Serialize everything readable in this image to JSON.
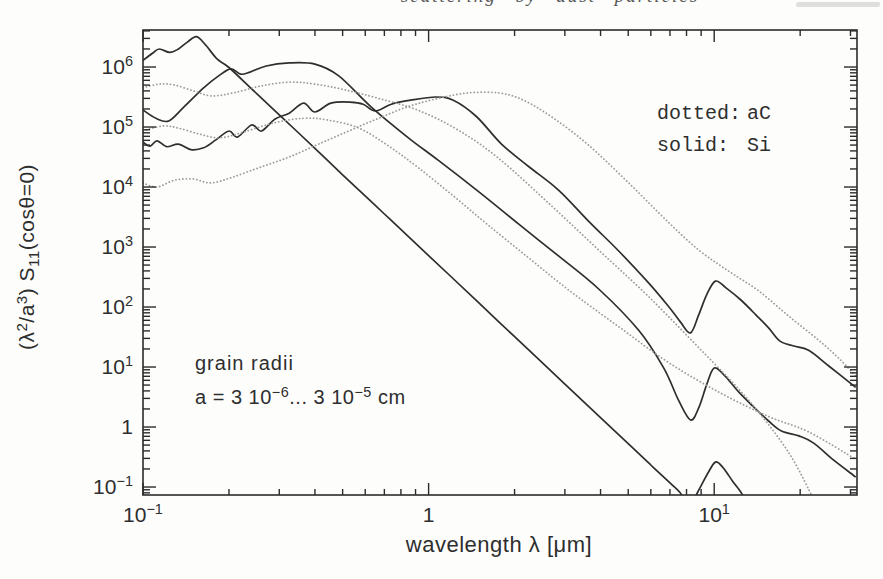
{
  "page": {
    "background": "#fdfdfc"
  },
  "header": {
    "fragment": "scattering by dust particles"
  },
  "chart_data": {
    "type": "line",
    "title": "",
    "xlabel": "wavelength λ [μm]",
    "ylabel_parts": [
      [
        "(λ",
        "n"
      ],
      [
        "2",
        "sup"
      ],
      [
        "/a",
        "n"
      ],
      [
        "3",
        "sup"
      ],
      [
        ")  S",
        "n"
      ],
      [
        "11",
        "sub"
      ],
      [
        "(cosθ=0)",
        "n"
      ]
    ],
    "x_axis": {
      "scale": "log",
      "min": 0.1,
      "max": 31.6,
      "log_min": -1,
      "log_max": 1.5,
      "grid": false,
      "tick_labels": [
        {
          "value": 0.1,
          "base": "10",
          "exp": "−1"
        },
        {
          "value": 1,
          "base": "1",
          "exp": ""
        },
        {
          "value": 10,
          "base": "10",
          "exp": "1"
        }
      ]
    },
    "y_axis": {
      "scale": "log",
      "min": 0.0736,
      "max": 4140000,
      "log_min": -1.133,
      "log_max": 6.617,
      "grid": false,
      "tick_labels": [
        {
          "value": 1000000,
          "base": "10",
          "exp": "6"
        },
        {
          "value": 100000,
          "base": "10",
          "exp": "5"
        },
        {
          "value": 10000,
          "base": "10",
          "exp": "4"
        },
        {
          "value": 1000,
          "base": "10",
          "exp": "3"
        },
        {
          "value": 100,
          "base": "10",
          "exp": "2"
        },
        {
          "value": 10,
          "base": "10",
          "exp": "1"
        },
        {
          "value": 1,
          "base": "1",
          "exp": ""
        },
        {
          "value": 0.1,
          "base": "10",
          "exp": "−1"
        }
      ]
    },
    "legend": [
      {
        "label": "dotted:",
        "material": "aC",
        "color": "#8f8f8f"
      },
      {
        "label": "solid:",
        "material": "Si",
        "color": "#1f1f1f"
      }
    ],
    "legend_position": "top-right",
    "annotations": [
      {
        "text": "grain radii"
      },
      {
        "parts": [
          [
            "a = 3 10",
            "n"
          ],
          [
            "−6",
            "sup"
          ],
          [
            "... 3 10",
            "n"
          ],
          [
            "−5",
            "sup"
          ],
          [
            " cm",
            "n"
          ]
        ]
      }
    ],
    "colors": {
      "solid": "#2e2e2e",
      "dotted": "#9c9c9c",
      "frame": "#2b2b2b",
      "text": "#2e2e2e"
    },
    "layout": {
      "left": 143,
      "right": 857,
      "top": 30,
      "bottom": 495,
      "xlabel_x": 499,
      "xlabel_y": 552,
      "ylabel_x": 34,
      "ylabel_y": 257,
      "legend_x_key": 657,
      "legend_x_val": 747,
      "legend_y": [
        119,
        151
      ],
      "anno_x": 195,
      "anno_y": [
        370,
        404
      ]
    },
    "series": [
      {
        "name": "Si-smallest-a",
        "material": "Si",
        "style": "solid",
        "points": [
          [
            0.1,
            1300000
          ],
          [
            0.108,
            1700000
          ],
          [
            0.114,
            2000000
          ],
          [
            0.124,
            1750000
          ],
          [
            0.133,
            2000000
          ],
          [
            0.143,
            2600000
          ],
          [
            0.154,
            3200000
          ],
          [
            0.166,
            2300000
          ],
          [
            0.182,
            1350000
          ],
          [
            0.2,
            980000
          ],
          [
            0.25,
            360000
          ],
          [
            0.3,
            160000
          ],
          [
            0.4,
            44000
          ],
          [
            0.5,
            16000
          ],
          [
            0.7,
            3550
          ],
          [
            1.0,
            720
          ],
          [
            1.5,
            117
          ],
          [
            2.0,
            32
          ],
          [
            3.0,
            5.2
          ],
          [
            4.0,
            1.43
          ],
          [
            5.0,
            0.53
          ],
          [
            6.0,
            0.233
          ],
          [
            7.0,
            0.117
          ],
          [
            7.6,
            0.08
          ],
          [
            7.9,
            0.058
          ],
          [
            8.4,
            0.06
          ],
          [
            8.9,
            0.095
          ],
          [
            9.5,
            0.17
          ],
          [
            10.1,
            0.26
          ],
          [
            10.7,
            0.215
          ],
          [
            11.6,
            0.125
          ],
          [
            12.4,
            0.082
          ],
          [
            12.9,
            0.058
          ]
        ]
      },
      {
        "name": "Si-middle-a",
        "material": "Si",
        "style": "solid",
        "points": [
          [
            0.1,
            192000
          ],
          [
            0.111,
            140000
          ],
          [
            0.123,
            126000
          ],
          [
            0.139,
            215000
          ],
          [
            0.163,
            450000
          ],
          [
            0.184,
            710000
          ],
          [
            0.203,
            930000
          ],
          [
            0.22,
            760000
          ],
          [
            0.238,
            830000
          ],
          [
            0.27,
            1040000
          ],
          [
            0.325,
            1170000
          ],
          [
            0.4,
            1120000
          ],
          [
            0.485,
            710000
          ],
          [
            0.63,
            215000
          ],
          [
            0.85,
            66000
          ],
          [
            1.08,
            28000
          ],
          [
            1.5,
            8300
          ],
          [
            2.07,
            2400
          ],
          [
            2.85,
            710
          ],
          [
            3.94,
            200
          ],
          [
            5.44,
            41
          ],
          [
            6.66,
            9.6
          ],
          [
            7.5,
            2.8
          ],
          [
            8.26,
            1.31
          ],
          [
            8.83,
            2.1
          ],
          [
            9.4,
            5.0
          ],
          [
            10.0,
            9.6
          ],
          [
            10.9,
            7.1
          ],
          [
            12.2,
            3.8
          ],
          [
            13.7,
            2.2
          ],
          [
            15.5,
            1.26
          ],
          [
            17.2,
            0.86
          ],
          [
            19.8,
            0.71
          ],
          [
            22.3,
            0.54
          ],
          [
            26.2,
            0.28
          ],
          [
            31.3,
            0.147
          ]
        ]
      },
      {
        "name": "Si-largest-a",
        "material": "Si",
        "style": "solid",
        "points": [
          [
            0.1,
            56000
          ],
          [
            0.106,
            48000
          ],
          [
            0.112,
            59000
          ],
          [
            0.121,
            47000
          ],
          [
            0.133,
            52000
          ],
          [
            0.147,
            42000
          ],
          [
            0.163,
            45000
          ],
          [
            0.18,
            61000
          ],
          [
            0.2,
            86000
          ],
          [
            0.214,
            68000
          ],
          [
            0.24,
            108000
          ],
          [
            0.26,
            86000
          ],
          [
            0.29,
            136000
          ],
          [
            0.325,
            170000
          ],
          [
            0.365,
            250000
          ],
          [
            0.4,
            178000
          ],
          [
            0.455,
            250000
          ],
          [
            0.53,
            260000
          ],
          [
            0.59,
            240000
          ],
          [
            0.65,
            185000
          ],
          [
            0.74,
            240000
          ],
          [
            0.865,
            280000
          ],
          [
            1.06,
            316000
          ],
          [
            1.22,
            280000
          ],
          [
            1.47,
            150000
          ],
          [
            1.8,
            52000
          ],
          [
            2.24,
            22000
          ],
          [
            2.85,
            8900
          ],
          [
            3.63,
            2700
          ],
          [
            4.63,
            860
          ],
          [
            5.9,
            250
          ],
          [
            6.9,
            104
          ],
          [
            7.62,
            56
          ],
          [
            8.26,
            37
          ],
          [
            8.8,
            71
          ],
          [
            9.4,
            158
          ],
          [
            10.1,
            270
          ],
          [
            11.0,
            208
          ],
          [
            12.4,
            131
          ],
          [
            14.0,
            74
          ],
          [
            15.5,
            45
          ],
          [
            17.0,
            27
          ],
          [
            19.0,
            22.4
          ],
          [
            21.4,
            19
          ],
          [
            25.2,
            10.4
          ],
          [
            31.3,
            4.6
          ]
        ]
      },
      {
        "name": "aC-smallest-a",
        "material": "aC",
        "style": "dotted",
        "points": [
          [
            0.1,
            450000
          ],
          [
            0.114,
            520000
          ],
          [
            0.129,
            500000
          ],
          [
            0.15,
            400000
          ],
          [
            0.174,
            330000
          ],
          [
            0.207,
            370000
          ],
          [
            0.258,
            480000
          ],
          [
            0.325,
            560000
          ],
          [
            0.4,
            520000
          ],
          [
            0.504,
            420000
          ],
          [
            0.668,
            300000
          ],
          [
            0.92,
            190000
          ],
          [
            1.27,
            89000
          ],
          [
            1.76,
            30000
          ],
          [
            2.63,
            5400
          ],
          [
            3.94,
            890
          ],
          [
            5.9,
            148
          ],
          [
            8.83,
            21
          ],
          [
            13.2,
            2.8
          ],
          [
            18.2,
            0.38
          ],
          [
            22.3,
            0.062
          ]
        ]
      },
      {
        "name": "aC-middle-a",
        "material": "aC",
        "style": "dotted",
        "points": [
          [
            0.1,
            86000
          ],
          [
            0.117,
            104000
          ],
          [
            0.133,
            96000
          ],
          [
            0.158,
            76000
          ],
          [
            0.186,
            66000
          ],
          [
            0.226,
            83000
          ],
          [
            0.287,
            117000
          ],
          [
            0.365,
            140000
          ],
          [
            0.446,
            130000
          ],
          [
            0.57,
            96000
          ],
          [
            0.725,
            48000
          ],
          [
            0.92,
            21000
          ],
          [
            1.22,
            7100
          ],
          [
            1.62,
            2300
          ],
          [
            2.24,
            660
          ],
          [
            3.1,
            191
          ],
          [
            4.63,
            47
          ],
          [
            6.9,
            12
          ],
          [
            10.4,
            3.8
          ],
          [
            15.5,
            1.5
          ],
          [
            21.4,
            0.83
          ],
          [
            31.3,
            0.29
          ]
        ]
      },
      {
        "name": "aC-largest-a",
        "material": "aC",
        "style": "dotted",
        "points": [
          [
            0.1,
            11700
          ],
          [
            0.112,
            10000
          ],
          [
            0.129,
            13000
          ],
          [
            0.15,
            13600
          ],
          [
            0.173,
            11700
          ],
          [
            0.207,
            14700
          ],
          [
            0.258,
            21500
          ],
          [
            0.325,
            31600
          ],
          [
            0.412,
            52000
          ],
          [
            0.525,
            86000
          ],
          [
            0.668,
            140000
          ],
          [
            0.85,
            220000
          ],
          [
            1.08,
            300000
          ],
          [
            1.38,
            370000
          ],
          [
            1.76,
            370000
          ],
          [
            2.15,
            280000
          ],
          [
            2.74,
            140000
          ],
          [
            3.63,
            50000
          ],
          [
            5.02,
            11700
          ],
          [
            6.9,
            2600
          ],
          [
            8.83,
            890
          ],
          [
            11.2,
            400
          ],
          [
            14.3,
            186
          ],
          [
            18.2,
            71
          ],
          [
            23.2,
            28
          ],
          [
            27.3,
            14
          ],
          [
            31.3,
            7.1
          ]
        ]
      }
    ]
  }
}
